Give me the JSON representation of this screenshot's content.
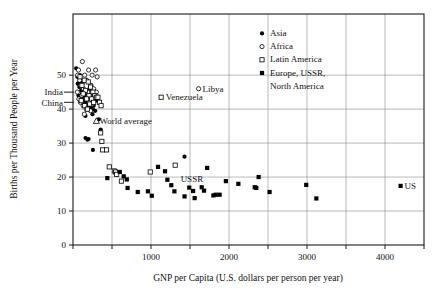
{
  "chart_data": {
    "type": "scatter",
    "title": "",
    "xlabel": "GNP per Capita (U.S. dollars per person per year)",
    "ylabel": "Births per Thousand People per Year",
    "xlim": [
      0,
      4500
    ],
    "ylim": [
      0,
      68
    ],
    "xticks": [
      0,
      500,
      1000,
      1500,
      2000,
      2500,
      3000,
      3500,
      4000,
      4500
    ],
    "xtick_labels": [
      "",
      "",
      "1000",
      "",
      "2000",
      "",
      "3000",
      "",
      "4000",
      ""
    ],
    "yticks": [
      0,
      10,
      20,
      30,
      40,
      50
    ],
    "ytick_labels": [
      "0",
      "10",
      "20",
      "30",
      "40",
      "50"
    ],
    "grid": true,
    "grid_x": [
      500,
      1000,
      1500,
      2000,
      2500,
      3000,
      3500,
      4000
    ],
    "grid_y": [
      10,
      20,
      30,
      40,
      50
    ],
    "legend_position": "top-right",
    "series": [
      {
        "name": "Asia",
        "marker": "filled-circle",
        "points": [
          [
            40,
            52
          ],
          [
            55,
            49.5
          ],
          [
            60,
            47.5
          ],
          [
            80,
            46.5
          ],
          [
            95,
            48
          ],
          [
            105,
            45.5
          ],
          [
            115,
            44.5
          ],
          [
            120,
            43.5
          ],
          [
            130,
            46
          ],
          [
            140,
            42.5
          ],
          [
            150,
            44
          ],
          [
            155,
            41.5
          ],
          [
            165,
            43
          ],
          [
            170,
            45
          ],
          [
            180,
            42
          ],
          [
            190,
            44.5
          ],
          [
            200,
            41
          ],
          [
            210,
            43.5
          ],
          [
            215,
            46.5
          ],
          [
            225,
            40.5
          ],
          [
            235,
            42
          ],
          [
            245,
            44
          ],
          [
            250,
            38.5
          ],
          [
            265,
            41
          ],
          [
            275,
            43
          ],
          [
            285,
            39.5
          ],
          [
            300,
            42.5
          ],
          [
            120,
            47.5
          ],
          [
            90,
            50
          ],
          [
            70,
            44
          ],
          [
            160,
            38
          ],
          [
            185,
            40
          ],
          [
            205,
            45.5
          ],
          [
            230,
            47
          ],
          [
            255,
            40
          ],
          [
            160,
            31.5
          ],
          [
            185,
            31
          ],
          [
            200,
            31.2
          ],
          [
            255,
            28
          ],
          [
            330,
            37
          ],
          [
            355,
            34
          ],
          [
            1430,
            26
          ]
        ]
      },
      {
        "name": "Africa",
        "marker": "open-circle",
        "points": [
          [
            120,
            54
          ],
          [
            70,
            51.5
          ],
          [
            200,
            51.5
          ],
          [
            290,
            51.5
          ],
          [
            60,
            50
          ],
          [
            150,
            50
          ],
          [
            245,
            50
          ],
          [
            310,
            49.5
          ],
          [
            85,
            48.5
          ],
          [
            175,
            48.5
          ],
          [
            100,
            47
          ],
          [
            230,
            47
          ],
          [
            135,
            46
          ],
          [
            265,
            46
          ],
          [
            55,
            45
          ],
          [
            190,
            45
          ],
          [
            300,
            45
          ],
          [
            110,
            44
          ],
          [
            215,
            44
          ],
          [
            75,
            43
          ],
          [
            160,
            43
          ],
          [
            280,
            43.5
          ],
          [
            95,
            42
          ],
          [
            205,
            42
          ],
          [
            130,
            41
          ],
          [
            250,
            41.5
          ],
          [
            170,
            40
          ],
          [
            225,
            39.5
          ],
          [
            145,
            38.5
          ],
          [
            1610,
            46
          ]
        ]
      },
      {
        "name": "Latin America",
        "marker": "open-square",
        "points": [
          [
            90,
            49.5
          ],
          [
            145,
            48.5
          ],
          [
            195,
            48
          ],
          [
            115,
            47
          ],
          [
            225,
            46.5
          ],
          [
            160,
            45.5
          ],
          [
            255,
            45
          ],
          [
            130,
            44.5
          ],
          [
            205,
            44
          ],
          [
            280,
            44
          ],
          [
            175,
            43
          ],
          [
            240,
            43
          ],
          [
            105,
            42.5
          ],
          [
            300,
            43.5
          ],
          [
            215,
            41.5
          ],
          [
            150,
            41
          ],
          [
            265,
            42
          ],
          [
            185,
            40
          ],
          [
            320,
            43.5
          ],
          [
            340,
            42
          ],
          [
            360,
            41
          ],
          [
            1130,
            43.5
          ],
          [
            355,
            33
          ],
          [
            370,
            30.5
          ],
          [
            380,
            28
          ],
          [
            430,
            28
          ],
          [
            465,
            23
          ],
          [
            530,
            21.8
          ],
          [
            545,
            21.5
          ],
          [
            560,
            20.8
          ],
          [
            620,
            18.8
          ],
          [
            1310,
            23.5
          ],
          [
            990,
            21.5
          ]
        ]
      },
      {
        "name": "Europe, USSR, North America",
        "marker": "filled-square",
        "points": [
          [
            440,
            19.7
          ],
          [
            600,
            21.5
          ],
          [
            650,
            20.2
          ],
          [
            690,
            19.3
          ],
          [
            700,
            16.8
          ],
          [
            830,
            15.6
          ],
          [
            960,
            15.8
          ],
          [
            1010,
            14.5
          ],
          [
            1090,
            23
          ],
          [
            1180,
            21.7
          ],
          [
            1210,
            19.2
          ],
          [
            1260,
            17.6
          ],
          [
            1300,
            15.8
          ],
          [
            1430,
            14.3
          ],
          [
            1490,
            16.9
          ],
          [
            1560,
            13.8
          ],
          [
            1540,
            15.9
          ],
          [
            1650,
            17
          ],
          [
            1680,
            16
          ],
          [
            1720,
            22.7
          ],
          [
            1800,
            14.6
          ],
          [
            1830,
            14.8
          ],
          [
            1880,
            14.8
          ],
          [
            1960,
            18.8
          ],
          [
            2120,
            18
          ],
          [
            2330,
            17
          ],
          [
            2350,
            16.8
          ],
          [
            2380,
            20
          ],
          [
            2520,
            15.6
          ],
          [
            2990,
            17.7
          ],
          [
            3120,
            13.7
          ],
          [
            4200,
            17.4
          ]
        ]
      },
      {
        "name": "World average",
        "marker": "open-triangle",
        "points": [
          [
            300,
            36.5
          ]
        ]
      }
    ],
    "annotations": [
      {
        "text": "India",
        "x": 20,
        "y": 45.0,
        "align": "right-tick"
      },
      {
        "text": "China",
        "x": 20,
        "y": 42.0,
        "align": "right-tick"
      },
      {
        "text": "World average",
        "x": 340,
        "y": 36.5,
        "align": "left"
      },
      {
        "text": "Venezuela",
        "x": 1190,
        "y": 43.5,
        "align": "left"
      },
      {
        "text": "Libya",
        "x": 1660,
        "y": 46.0,
        "align": "left"
      },
      {
        "text": "USSR",
        "x": 1380,
        "y": 19.5,
        "align": "left"
      },
      {
        "text": "US",
        "x": 4250,
        "y": 17.4,
        "align": "left"
      }
    ],
    "legend_entries": [
      {
        "label": "Asia",
        "marker": "filled-circle"
      },
      {
        "label": "Africa",
        "marker": "open-circle"
      },
      {
        "label": "Latin America",
        "marker": "open-square"
      },
      {
        "label": "Europe, USSR,",
        "marker": "filled-square"
      },
      {
        "label": "North America",
        "marker": "none"
      }
    ],
    "colors": {
      "marker": "#000000",
      "axis": "#1a1a1a",
      "grid": "#8a8a8a",
      "background": "#ffffff"
    }
  }
}
